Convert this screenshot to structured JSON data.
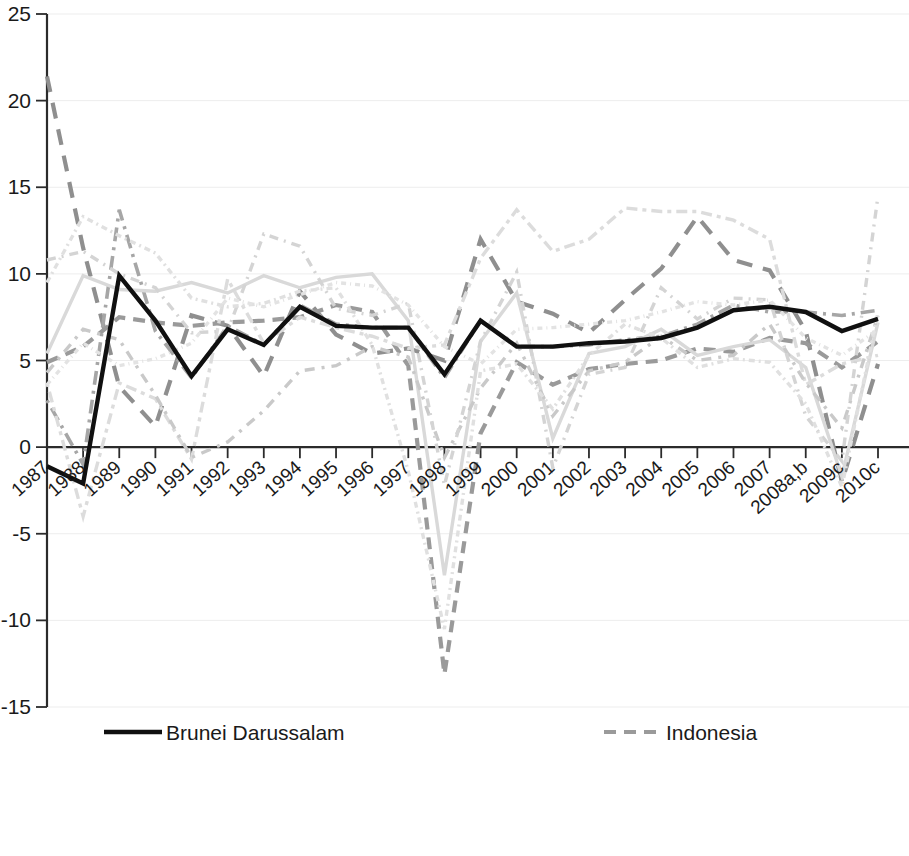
{
  "chart_data": {
    "type": "line",
    "title": "",
    "subtitle": "",
    "xlabel": "",
    "ylabel": "",
    "xlim_categories_first": "1987",
    "xlim_categories_last": "2010c",
    "ylim": [
      -15,
      25
    ],
    "ytick_step": 5,
    "grid": true,
    "grid_axis": "y",
    "legend_position": "bottom",
    "legend_columns": 2,
    "x": [
      "1987",
      "1988",
      "1989",
      "1990",
      "1991",
      "1992",
      "1993",
      "1994",
      "1995",
      "1996",
      "1997",
      "1998",
      "1999",
      "2000",
      "2001",
      "2002",
      "2003",
      "2004",
      "2005",
      "2006",
      "2007",
      "2008a,b",
      "2009c",
      "2010c"
    ],
    "yticks": [
      -15,
      -10,
      -5,
      0,
      5,
      10,
      15,
      20,
      25
    ],
    "ytick_labels": [
      "-15",
      "-10",
      "-5",
      "0",
      "5",
      "10",
      "15",
      "20",
      "25"
    ],
    "series": [
      {
        "name": "Brunei Darussalam",
        "color": "#101010",
        "width": 4.4,
        "dash": "none",
        "values": [
          -1.1,
          -2.1,
          9.9,
          7.3,
          4.1,
          6.8,
          5.9,
          8.1,
          7.0,
          6.9,
          6.9,
          4.2,
          7.3,
          5.8,
          5.8,
          6.0,
          6.1,
          6.3,
          6.9,
          7.9,
          8.1,
          7.8,
          6.7,
          7.4
        ]
      },
      {
        "name": "Cambodia",
        "color": "#8f8f8f",
        "width": 4.2,
        "dash": "16,11",
        "values": [
          21.4,
          11.5,
          3.5,
          1.2,
          7.6,
          7.0,
          4.1,
          9.0,
          6.5,
          5.4,
          5.7,
          5.0,
          12.0,
          8.4,
          7.7,
          6.6,
          8.5,
          10.3,
          13.3,
          10.8,
          10.2,
          6.7,
          -2.0,
          4.8
        ]
      },
      {
        "name": "Indonesia",
        "color": "#9a9a9a",
        "width": 4.2,
        "dash": "12,8",
        "values": [
          4.9,
          5.8,
          7.5,
          7.2,
          7.0,
          7.2,
          7.3,
          7.5,
          8.2,
          7.8,
          4.7,
          -13.1,
          0.8,
          4.9,
          3.6,
          4.5,
          4.8,
          5.0,
          5.7,
          5.5,
          6.3,
          6.0,
          4.6,
          6.1
        ]
      },
      {
        "name": "Lao People's Democratic Republic",
        "color": "#a6a6a6",
        "width": 3.6,
        "dash": "3,6,14,6",
        "values": [
          2.7,
          -1.0,
          13.7,
          6.7,
          4.0,
          7.0,
          5.9,
          8.2,
          7.1,
          6.9,
          6.9,
          4.0,
          7.3,
          5.8,
          5.8,
          5.9,
          6.2,
          6.4,
          7.1,
          8.2,
          7.8,
          7.8,
          7.6,
          7.9
        ]
      },
      {
        "name": "Malaysia",
        "color": "#d9d9d9",
        "width": 3.4,
        "dash": "none",
        "values": [
          5.4,
          9.9,
          9.1,
          9.0,
          9.5,
          8.9,
          9.9,
          9.2,
          9.8,
          10.0,
          7.3,
          -7.4,
          6.1,
          8.9,
          0.5,
          5.4,
          5.8,
          6.8,
          5.3,
          5.8,
          6.2,
          4.6,
          -1.7,
          7.2
        ]
      },
      {
        "name": "Myanmar",
        "color": "#dcdcdc",
        "width": 3.4,
        "dash": "4,5,11,5",
        "values": [
          3.7,
          -4.0,
          3.7,
          2.8,
          -0.7,
          9.7,
          6.0,
          7.5,
          6.9,
          6.4,
          5.7,
          5.9,
          10.9,
          13.7,
          11.3,
          12.0,
          13.8,
          13.6,
          13.6,
          13.1,
          12.0,
          3.6,
          4.8,
          5.3
        ]
      },
      {
        "name": "Philippines",
        "color": "#c9c9c9",
        "width": 3.4,
        "dash": "10,7,3,7",
        "values": [
          4.3,
          6.8,
          6.2,
          3.0,
          -0.6,
          0.3,
          2.1,
          4.4,
          4.7,
          5.8,
          5.2,
          -0.6,
          3.4,
          6.0,
          1.8,
          4.4,
          4.9,
          6.4,
          5.0,
          5.3,
          7.1,
          3.7,
          1.1,
          7.6
        ]
      },
      {
        "name": "Singapore",
        "color": "#d4d4d4",
        "width": 3.4,
        "dash": "9,6,2,6",
        "values": [
          10.8,
          11.3,
          10.0,
          9.2,
          6.6,
          6.7,
          12.3,
          11.6,
          8.0,
          7.6,
          8.3,
          -2.2,
          6.1,
          10.1,
          -1.2,
          4.2,
          4.6,
          9.2,
          7.4,
          8.6,
          8.5,
          1.8,
          -0.8,
          14.5
        ]
      },
      {
        "name": "Thailand",
        "color": "#e0e0e0",
        "width": 3.4,
        "dash": "6,4,2,4",
        "values": [
          9.5,
          13.3,
          12.2,
          11.2,
          8.6,
          8.1,
          8.3,
          9.0,
          9.2,
          5.9,
          -1.4,
          -10.5,
          4.4,
          4.8,
          2.2,
          5.3,
          7.1,
          6.3,
          4.6,
          5.1,
          4.9,
          2.5,
          -2.3,
          7.8
        ]
      },
      {
        "name": "Vietnam",
        "color": "#e3e3e3",
        "width": 3.4,
        "dash": "5,4,1,4",
        "values": [
          3.6,
          6.0,
          4.7,
          5.1,
          6.0,
          8.6,
          8.1,
          8.8,
          9.5,
          9.3,
          8.2,
          5.8,
          4.8,
          6.8,
          6.9,
          7.1,
          7.3,
          7.8,
          8.4,
          8.2,
          8.5,
          6.3,
          5.3,
          6.8
        ]
      }
    ]
  },
  "legend": {
    "columns": [
      {
        "items": [
          {
            "label": "Brunei Darussalam",
            "series": "Brunei Darussalam"
          },
          {
            "label": "Indonesia",
            "series": "Indonesia"
          },
          {
            "label": "Malaysia",
            "series": "Malaysia"
          },
          {
            "label": "Philippines",
            "series": "Philippines"
          },
          {
            "label": "Thailand",
            "series": "Thailand"
          }
        ]
      },
      {
        "items": [
          {
            "label": "Cambodia",
            "series": "Cambodia"
          },
          {
            "label": "Lao People's Democratic Republic",
            "series": "Lao People's Democratic Republic"
          },
          {
            "label": "Myanmar",
            "series": "Myanmar"
          },
          {
            "label": "Singapore",
            "series": "Singapore"
          },
          {
            "label": "Vietnam",
            "series": "Vietnam"
          }
        ]
      }
    ]
  }
}
